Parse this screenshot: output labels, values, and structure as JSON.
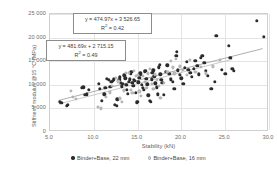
{
  "chart_data": {
    "type": "scatter",
    "title": "",
    "xlabel": "Stability (kN)",
    "ylabel": "Stiffness modulus @15 °C (MPa)",
    "xlim": [
      5.0,
      30.0
    ],
    "ylim": [
      0,
      25000
    ],
    "grid": true,
    "legend_position": "bottom",
    "xticks": [
      "5.0",
      "10.0",
      "15.0",
      "20.0",
      "25.0",
      "30.0"
    ],
    "xtick_values": [
      5.0,
      10.0,
      15.0,
      20.0,
      25.0,
      30.0
    ],
    "yticks": [
      "0",
      "5 000",
      "10 000",
      "15 000",
      "20 000",
      "25 000"
    ],
    "ytick_values": [
      0,
      5000,
      10000,
      15000,
      20000,
      25000
    ],
    "annotations": [
      {
        "name": "trendline-equation-22mm",
        "equation": "y = 474.97x + 3 526.65",
        "r2_label": "R",
        "r2_exponent": "2",
        "r2_value": " = 0.42",
        "slope": 474.97,
        "intercept": 3526.65,
        "r2": 0.42,
        "series": "Binder+Base, 22 mm"
      },
      {
        "name": "trendline-equation-16mm",
        "equation": "y = 481.69x + 2 715.15",
        "r2_label": "R",
        "r2_exponent": "2",
        "r2_value": " = 0.49",
        "slope": 481.69,
        "intercept": 2715.15,
        "r2": 0.49,
        "series": "Binder+Base, 16 mm"
      }
    ],
    "series": [
      {
        "name": "Binder+Base, 22 mm",
        "marker": "filled-circle",
        "color": "#2b2b2b",
        "points": [
          [
            6.1,
            6400
          ],
          [
            6.3,
            6200
          ],
          [
            6.9,
            5500
          ],
          [
            7.0,
            5700
          ],
          [
            8.6,
            9400
          ],
          [
            8.8,
            9500
          ],
          [
            9.0,
            7900
          ],
          [
            9.2,
            8000
          ],
          [
            9.4,
            9000
          ],
          [
            10.6,
            10200
          ],
          [
            10.7,
            9100
          ],
          [
            10.9,
            6600
          ],
          [
            11.2,
            8000
          ],
          [
            11.3,
            9300
          ],
          [
            11.5,
            11300
          ],
          [
            11.7,
            11100
          ],
          [
            11.9,
            9600
          ],
          [
            12.0,
            10600
          ],
          [
            12.2,
            10900
          ],
          [
            12.3,
            11200
          ],
          [
            12.4,
            5700
          ],
          [
            12.6,
            5500
          ],
          [
            12.7,
            6900
          ],
          [
            12.9,
            11000
          ],
          [
            13.0,
            11600
          ],
          [
            13.1,
            10400
          ],
          [
            13.2,
            9700
          ],
          [
            13.3,
            10200
          ],
          [
            13.5,
            12000
          ],
          [
            13.6,
            11400
          ],
          [
            13.7,
            10000
          ],
          [
            13.8,
            9000
          ],
          [
            13.9,
            8100
          ],
          [
            14.0,
            10600
          ],
          [
            14.1,
            11200
          ],
          [
            14.2,
            12300
          ],
          [
            14.3,
            12800
          ],
          [
            14.4,
            10400
          ],
          [
            14.5,
            9800
          ],
          [
            14.6,
            11000
          ],
          [
            14.7,
            10900
          ],
          [
            14.8,
            8300
          ],
          [
            14.9,
            6300
          ],
          [
            15.0,
            6400
          ],
          [
            15.1,
            10500
          ],
          [
            15.2,
            11500
          ],
          [
            15.3,
            12400
          ],
          [
            15.4,
            12100
          ],
          [
            15.5,
            10000
          ],
          [
            15.6,
            9400
          ],
          [
            15.7,
            8900
          ],
          [
            15.8,
            12700
          ],
          [
            15.9,
            13000
          ],
          [
            16.0,
            11300
          ],
          [
            16.1,
            10100
          ],
          [
            16.2,
            7800
          ],
          [
            16.4,
            6600
          ],
          [
            16.5,
            6400
          ],
          [
            16.6,
            11200
          ],
          [
            16.7,
            12500
          ],
          [
            16.8,
            13100
          ],
          [
            16.9,
            11800
          ],
          [
            17.0,
            10300
          ],
          [
            17.2,
            9500
          ],
          [
            17.3,
            8000
          ],
          [
            17.4,
            13700
          ],
          [
            17.5,
            14200
          ],
          [
            17.6,
            12200
          ],
          [
            17.7,
            11000
          ],
          [
            17.8,
            10400
          ],
          [
            18.0,
            7900
          ],
          [
            18.2,
            12800
          ],
          [
            18.4,
            14100
          ],
          [
            18.6,
            12300
          ],
          [
            18.8,
            11200
          ],
          [
            19.0,
            10600
          ],
          [
            19.2,
            9200
          ],
          [
            19.4,
            16200
          ],
          [
            19.5,
            17000
          ],
          [
            19.6,
            13100
          ],
          [
            19.8,
            12100
          ],
          [
            20.0,
            11400
          ],
          [
            20.2,
            10200
          ],
          [
            20.4,
            13600
          ],
          [
            20.6,
            14900
          ],
          [
            20.8,
            13200
          ],
          [
            21.0,
            12500
          ],
          [
            21.2,
            11700
          ],
          [
            21.4,
            13400
          ],
          [
            21.6,
            15100
          ],
          [
            21.8,
            14000
          ],
          [
            22.0,
            12200
          ],
          [
            22.2,
            15700
          ],
          [
            22.4,
            16100
          ],
          [
            22.6,
            14600
          ],
          [
            22.8,
            13000
          ],
          [
            23.0,
            11900
          ],
          [
            23.4,
            9200
          ],
          [
            23.8,
            10600
          ],
          [
            24.0,
            20400
          ],
          [
            24.6,
            13200
          ],
          [
            25.0,
            12300
          ],
          [
            25.4,
            18300
          ],
          [
            25.6,
            15700
          ],
          [
            25.8,
            13400
          ],
          [
            26.0,
            13000
          ],
          [
            28.6,
            23500
          ],
          [
            29.4,
            20200
          ]
        ]
      },
      {
        "name": "Binder+Base, 16 mm",
        "marker": "open-circle",
        "color": "#c7c7c7",
        "points": [
          [
            7.4,
            8700
          ],
          [
            7.6,
            7500
          ],
          [
            8.0,
            7000
          ],
          [
            10.5,
            5300
          ],
          [
            10.8,
            5000
          ],
          [
            11.4,
            7400
          ],
          [
            11.8,
            8400
          ],
          [
            12.1,
            9800
          ],
          [
            12.5,
            11400
          ],
          [
            12.8,
            10700
          ],
          [
            13.0,
            7100
          ],
          [
            13.2,
            6400
          ],
          [
            13.4,
            8800
          ],
          [
            13.7,
            12600
          ],
          [
            14.0,
            12500
          ],
          [
            14.2,
            9000
          ],
          [
            14.4,
            8200
          ],
          [
            14.6,
            12900
          ],
          [
            14.8,
            11900
          ],
          [
            15.0,
            12100
          ],
          [
            15.2,
            8600
          ],
          [
            15.4,
            7600
          ],
          [
            15.6,
            11800
          ],
          [
            15.8,
            10600
          ],
          [
            16.0,
            9300
          ],
          [
            16.2,
            12400
          ],
          [
            16.4,
            13300
          ],
          [
            16.6,
            10200
          ],
          [
            16.8,
            9100
          ],
          [
            17.0,
            12200
          ],
          [
            17.2,
            11100
          ],
          [
            17.4,
            9800
          ],
          [
            17.6,
            7200
          ],
          [
            18.0,
            10400
          ],
          [
            18.4,
            12800
          ],
          [
            18.8,
            15100
          ],
          [
            19.0,
            13700
          ],
          [
            19.2,
            12400
          ],
          [
            19.4,
            15500
          ],
          [
            19.8,
            13900
          ],
          [
            20.2,
            13100
          ],
          [
            20.6,
            12100
          ],
          [
            21.0,
            15300
          ],
          [
            21.6,
            12700
          ],
          [
            22.2,
            13800
          ],
          [
            22.8,
            12400
          ],
          [
            23.6,
            13900
          ],
          [
            24.4,
            15300
          ]
        ]
      }
    ]
  },
  "legend": {
    "entries": [
      {
        "label": "Binder+Base, 22 mm",
        "style": "dark"
      },
      {
        "label": "Binder+Base, 16 mm",
        "style": "light"
      }
    ]
  }
}
